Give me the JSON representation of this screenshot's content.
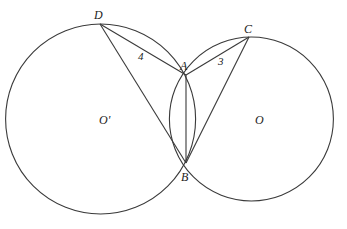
{
  "diagram": {
    "type": "geometry-two-intersecting-circles",
    "stroke_color": "#3a3a3a",
    "circles": [
      {
        "name": "O'",
        "cx": 100.6,
        "cy": 119,
        "r": 95
      },
      {
        "name": "O",
        "cx": 251.4,
        "cy": 119,
        "r": 82
      }
    ],
    "points": {
      "D": {
        "x": 100,
        "y": 24
      },
      "A": {
        "x": 186,
        "y": 75
      },
      "C": {
        "x": 249,
        "y": 37
      },
      "B": {
        "x": 186,
        "y": 163
      }
    },
    "segments": [
      "DA",
      "DB",
      "AC",
      "CB",
      "AB"
    ],
    "labels": {
      "D": "D",
      "A": "A",
      "C": "C",
      "B": "B",
      "O_prime": "O'",
      "O": "O",
      "angle4": "4",
      "angle3": "3"
    }
  }
}
